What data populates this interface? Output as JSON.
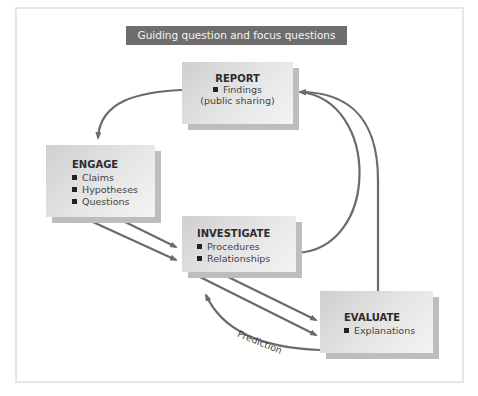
{
  "banner": {
    "label": "Guiding question and focus questions"
  },
  "nodes": {
    "report": {
      "title": "REPORT",
      "items": [
        "Findings"
      ],
      "subtitle": "(public sharing)"
    },
    "engage": {
      "title": "ENGAGE",
      "items": [
        "Claims",
        "Hypotheses",
        "Questions"
      ]
    },
    "investigate": {
      "title": "INVESTIGATE",
      "items": [
        "Procedures",
        "Relationships"
      ]
    },
    "evaluate": {
      "title": "EVALUATE",
      "items": [
        "Explanations"
      ]
    }
  },
  "edges": [
    {
      "from": "report",
      "to": "engage",
      "label": ""
    },
    {
      "from": "engage",
      "to": "investigate",
      "label": "",
      "count": 2
    },
    {
      "from": "investigate",
      "to": "report",
      "label": ""
    },
    {
      "from": "investigate",
      "to": "evaluate",
      "label": "",
      "count": 2
    },
    {
      "from": "evaluate",
      "to": "report",
      "label": ""
    },
    {
      "from": "evaluate",
      "to": "investigate",
      "label": "Prediction"
    }
  ],
  "colors": {
    "arrow": "#6b6b6b",
    "banner": "#6e6e6e",
    "box_shadow": "#bdbdbd",
    "frame": "#e6e6e6"
  }
}
